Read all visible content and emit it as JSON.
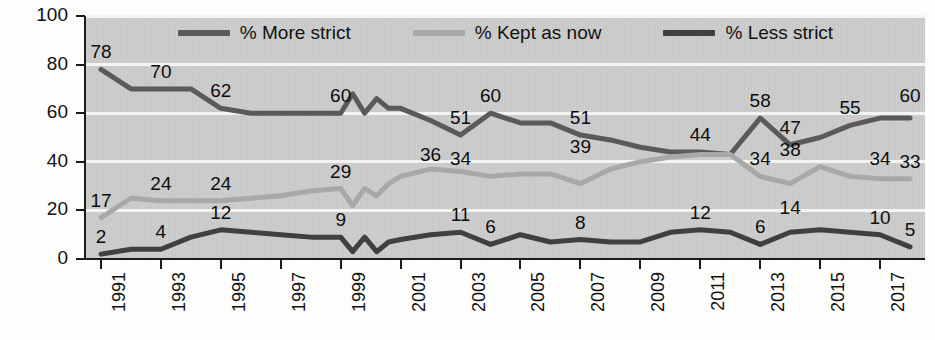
{
  "chart_data": {
    "type": "line",
    "title": "",
    "xlabel": "",
    "ylabel": "",
    "ylim": [
      0,
      100
    ],
    "xlim": [
      1990.5,
      2018.5
    ],
    "yticks": [
      0,
      20,
      40,
      60,
      80,
      100
    ],
    "grid": true,
    "legend_position": "top-center",
    "x_tick_labels": [
      "1991",
      "1993",
      "1995",
      "1997",
      "1999",
      "2001",
      "2003",
      "2005",
      "2007",
      "2009",
      "2011",
      "2013",
      "2015",
      "2017"
    ],
    "x_tick_values": [
      1991,
      1993,
      1995,
      1997,
      1999,
      2001,
      2003,
      2005,
      2007,
      2009,
      2011,
      2013,
      2015,
      2017
    ],
    "series": [
      {
        "name": "% More strict",
        "color": "#5a5a5a",
        "x": [
          1991,
          1992,
          1993,
          1994,
          1995,
          1996,
          1997,
          1998,
          1999,
          1999.4,
          1999.8,
          2000.2,
          2000.6,
          2001,
          2002,
          2003,
          2004,
          2005,
          2006,
          2007,
          2008,
          2009,
          2010,
          2011,
          2012,
          2013,
          2014,
          2015,
          2016,
          2017,
          2018
        ],
        "values": [
          78,
          70,
          70,
          70,
          62,
          60,
          60,
          60,
          60,
          68,
          60,
          66,
          62,
          62,
          57,
          51,
          60,
          56,
          56,
          51,
          49,
          46,
          44,
          44,
          43,
          58,
          47,
          50,
          55,
          58,
          58
        ],
        "labels": [
          {
            "x": 1991,
            "y": 78,
            "text": "78"
          },
          {
            "x": 1993,
            "y": 70,
            "text": "70"
          },
          {
            "x": 1995,
            "y": 62,
            "text": "62"
          },
          {
            "x": 1999,
            "y": 60,
            "text": "60"
          },
          {
            "x": 2003,
            "y": 51,
            "text": "51"
          },
          {
            "x": 2004,
            "y": 60,
            "text": "60"
          },
          {
            "x": 2007,
            "y": 51,
            "text": "51"
          },
          {
            "x": 2011,
            "y": 44,
            "text": "44"
          },
          {
            "x": 2013,
            "y": 58,
            "text": "58"
          },
          {
            "x": 2014,
            "y": 47,
            "text": "47"
          },
          {
            "x": 2016,
            "y": 55,
            "text": "55"
          },
          {
            "x": 2018,
            "y": 60,
            "text": "60"
          }
        ]
      },
      {
        "name": "% Kept as now",
        "color": "#a8a8a8",
        "x": [
          1991,
          1992,
          1993,
          1994,
          1995,
          1996,
          1997,
          1998,
          1999,
          1999.4,
          1999.8,
          2000.2,
          2000.6,
          2001,
          2002,
          2003,
          2004,
          2005,
          2006,
          2007,
          2008,
          2009,
          2010,
          2011,
          2012,
          2013,
          2014,
          2015,
          2016,
          2017,
          2018
        ],
        "values": [
          17,
          25,
          24,
          24,
          24,
          25,
          26,
          28,
          29,
          22,
          29,
          26,
          31,
          34,
          37,
          36,
          34,
          35,
          35,
          31,
          37,
          40,
          42,
          43,
          43,
          34,
          31,
          38,
          34,
          33,
          33
        ],
        "labels": [
          {
            "x": 1991,
            "y": 17,
            "text": "17"
          },
          {
            "x": 1993,
            "y": 24,
            "text": "24"
          },
          {
            "x": 1995,
            "y": 24,
            "text": "24"
          },
          {
            "x": 1999,
            "y": 29,
            "text": "29"
          },
          {
            "x": 2002,
            "y": 36,
            "text": "36"
          },
          {
            "x": 2003,
            "y": 34,
            "text": "34"
          },
          {
            "x": 2007,
            "y": 39,
            "text": "39"
          },
          {
            "x": 2013,
            "y": 34,
            "text": "34"
          },
          {
            "x": 2014,
            "y": 38,
            "text": "38"
          },
          {
            "x": 2017,
            "y": 34,
            "text": "34"
          },
          {
            "x": 2018,
            "y": 33,
            "text": "33"
          }
        ]
      },
      {
        "name": "% Less strict",
        "color": "#404040",
        "x": [
          1991,
          1992,
          1993,
          1994,
          1995,
          1996,
          1997,
          1998,
          1999,
          1999.4,
          1999.8,
          2000.2,
          2000.6,
          2001,
          2002,
          2003,
          2004,
          2005,
          2006,
          2007,
          2008,
          2009,
          2010,
          2011,
          2012,
          2013,
          2014,
          2015,
          2016,
          2017,
          2018
        ],
        "values": [
          2,
          4,
          4,
          9,
          12,
          11,
          10,
          9,
          9,
          3,
          9,
          3,
          7,
          8,
          10,
          11,
          6,
          10,
          7,
          8,
          7,
          7,
          11,
          12,
          11,
          6,
          11,
          12,
          11,
          10,
          5
        ],
        "labels": [
          {
            "x": 1991,
            "y": 2,
            "text": "2"
          },
          {
            "x": 1993,
            "y": 4,
            "text": "4"
          },
          {
            "x": 1995,
            "y": 12,
            "text": "12"
          },
          {
            "x": 1999,
            "y": 9,
            "text": "9"
          },
          {
            "x": 2003,
            "y": 11,
            "text": "11"
          },
          {
            "x": 2004,
            "y": 6,
            "text": "6"
          },
          {
            "x": 2007,
            "y": 8,
            "text": "8"
          },
          {
            "x": 2011,
            "y": 12,
            "text": "12"
          },
          {
            "x": 2013,
            "y": 6,
            "text": "6"
          },
          {
            "x": 2014,
            "y": 14,
            "text": "14"
          },
          {
            "x": 2017,
            "y": 10,
            "text": "10"
          },
          {
            "x": 2018,
            "y": 5,
            "text": "5"
          }
        ]
      }
    ]
  },
  "legend": {
    "items": [
      {
        "label": "% More strict",
        "color": "#5a5a5a"
      },
      {
        "label": "% Kept as now",
        "color": "#a8a8a8"
      },
      {
        "label": "% Less strict",
        "color": "#404040"
      }
    ]
  },
  "axes": {
    "y_labels": [
      "100",
      "80",
      "60",
      "40",
      "20",
      "0"
    ],
    "x_labels": [
      "1991",
      "1993",
      "1995",
      "1997",
      "1999",
      "2001",
      "2003",
      "2005",
      "2007",
      "2009",
      "2011",
      "2013",
      "2015",
      "2017"
    ]
  },
  "style": {
    "plot_background": "#c9c9c9",
    "gridline_color": "#f4f4f2",
    "axis_color": "#1a1a1a",
    "page_background": "#fdfdfc"
  },
  "title_fragment": ""
}
